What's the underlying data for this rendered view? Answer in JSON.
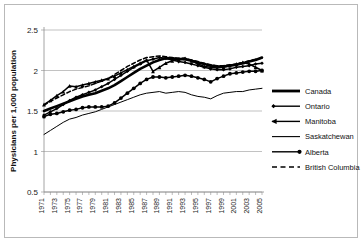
{
  "chart_data": {
    "type": "line",
    "title": "",
    "xlabel": "",
    "ylabel": "Physicians per 1,000 population",
    "ylim": [
      0.5,
      2.5
    ],
    "yticks": [
      "0.5",
      "1",
      "1.5",
      "2",
      "2.5"
    ],
    "ytick_values": [
      0.5,
      1,
      1.5,
      2,
      2.5
    ],
    "grid": true,
    "legend_position": "right",
    "x": [
      1971,
      1972,
      1973,
      1974,
      1975,
      1976,
      1977,
      1978,
      1979,
      1980,
      1981,
      1982,
      1983,
      1984,
      1985,
      1986,
      1987,
      1988,
      1989,
      1990,
      1991,
      1992,
      1993,
      1994,
      1995,
      1996,
      1997,
      1998,
      1999,
      2000,
      2001,
      2002,
      2003,
      2004,
      2005
    ],
    "xtick_labels": [
      "1971",
      "1973",
      "1975",
      "1977",
      "1979",
      "1981",
      "1983",
      "1985",
      "1987",
      "1989",
      "1991",
      "1993",
      "1995",
      "1997",
      "1999",
      "2001",
      "2003",
      "2005"
    ],
    "series": [
      {
        "name": "Canada",
        "marker": "none",
        "dash": "solid",
        "width": 2.6,
        "values": [
          1.5,
          1.53,
          1.56,
          1.59,
          1.62,
          1.65,
          1.68,
          1.7,
          1.72,
          1.75,
          1.78,
          1.82,
          1.87,
          1.92,
          1.97,
          2.02,
          2.06,
          2.1,
          2.13,
          2.15,
          2.15,
          2.14,
          2.14,
          2.12,
          2.1,
          2.08,
          2.06,
          2.05,
          2.05,
          2.06,
          2.07,
          2.09,
          2.11,
          2.13,
          2.16
        ]
      },
      {
        "name": "Ontario",
        "marker": "diamond",
        "dash": "solid",
        "width": 1.5,
        "values": [
          1.45,
          1.49,
          1.53,
          1.58,
          1.63,
          1.67,
          1.7,
          1.73,
          1.76,
          1.8,
          1.84,
          1.89,
          1.94,
          1.99,
          2.04,
          2.08,
          2.12,
          2.14,
          2.16,
          2.15,
          2.13,
          2.11,
          2.1,
          2.08,
          2.06,
          2.04,
          2.02,
          2.01,
          2.01,
          2.02,
          2.04,
          2.05,
          2.06,
          2.08,
          2.09
        ]
      },
      {
        "name": "Manitoba",
        "marker": "triangle",
        "dash": "solid",
        "width": 1.5,
        "values": [
          1.58,
          1.63,
          1.69,
          1.74,
          1.81,
          1.8,
          1.82,
          1.84,
          1.86,
          1.88,
          1.9,
          1.93,
          1.97,
          2.01,
          2.05,
          2.09,
          2.13,
          1.99,
          2.04,
          2.09,
          2.12,
          2.14,
          2.15,
          2.12,
          2.08,
          2.05,
          2.04,
          2.03,
          2.04,
          2.06,
          2.08,
          2.1,
          2.08,
          2.04,
          2.0
        ]
      },
      {
        "name": "Saskatchewan",
        "marker": "none",
        "dash": "solid",
        "width": 1.0,
        "values": [
          1.21,
          1.26,
          1.31,
          1.36,
          1.4,
          1.42,
          1.45,
          1.47,
          1.49,
          1.52,
          1.55,
          1.58,
          1.61,
          1.64,
          1.67,
          1.7,
          1.72,
          1.73,
          1.74,
          1.72,
          1.73,
          1.74,
          1.73,
          1.7,
          1.68,
          1.67,
          1.65,
          1.69,
          1.72,
          1.73,
          1.74,
          1.74,
          1.76,
          1.77,
          1.78
        ]
      },
      {
        "name": "Alberta",
        "marker": "circle",
        "dash": "solid",
        "width": 1.5,
        "values": [
          1.43,
          1.46,
          1.47,
          1.49,
          1.51,
          1.52,
          1.54,
          1.55,
          1.55,
          1.55,
          1.56,
          1.6,
          1.66,
          1.72,
          1.78,
          1.84,
          1.89,
          1.92,
          1.92,
          1.91,
          1.92,
          1.93,
          1.94,
          1.93,
          1.91,
          1.89,
          1.86,
          1.9,
          1.93,
          1.96,
          1.97,
          1.98,
          1.99,
          1.99,
          2.0
        ]
      },
      {
        "name": "British Columbia",
        "marker": "none",
        "dash": "dashed",
        "width": 1.5,
        "values": [
          1.57,
          1.62,
          1.66,
          1.7,
          1.74,
          1.77,
          1.79,
          1.81,
          1.84,
          1.87,
          1.9,
          1.95,
          2.0,
          2.05,
          2.09,
          2.13,
          2.16,
          2.17,
          2.18,
          2.17,
          2.16,
          2.15,
          2.15,
          2.13,
          2.11,
          2.09,
          2.07,
          2.06,
          2.06,
          2.07,
          2.08,
          2.1,
          2.12,
          2.14,
          2.15
        ]
      }
    ]
  },
  "legend": {
    "items": [
      {
        "label": "Canada",
        "marker": "none",
        "dash": "solid",
        "width": 2.8
      },
      {
        "label": "Ontario",
        "marker": "diamond-left",
        "dash": "solid",
        "width": 1.4
      },
      {
        "label": "Manitoba",
        "marker": "triangle-left",
        "dash": "solid",
        "width": 1.4
      },
      {
        "label": "Saskatchewan",
        "marker": "none",
        "dash": "solid",
        "width": 1.1
      },
      {
        "label": "Alberta",
        "marker": "circle-right",
        "dash": "solid",
        "width": 1.4
      },
      {
        "label": "British Columbia",
        "marker": "none",
        "dash": "dashed",
        "width": 1.4
      }
    ]
  },
  "colors": {
    "series": "#000000",
    "grid": "#a8a8a8",
    "axis": "#8e8e8e",
    "border": "#b9b9b9",
    "background": "#ffffff",
    "text": "#111111"
  }
}
